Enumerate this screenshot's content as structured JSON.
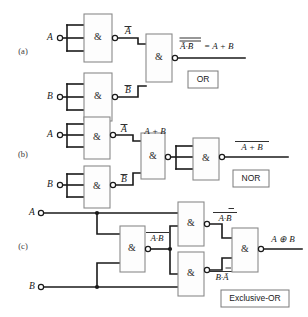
{
  "figure": {
    "gate_symbol": "&",
    "panels": [
      {
        "id": "(a)",
        "function_label": "OR",
        "inputs": [
          "A",
          "B"
        ],
        "intermediate_labels": [
          "Ā",
          "B̄"
        ],
        "output_expression_left": "Ā·B̄",
        "output_expression_right": "= A + B",
        "gate_count": 3
      },
      {
        "id": "(b)",
        "function_label": "NOR",
        "inputs": [
          "A",
          "B"
        ],
        "intermediate_labels": [
          "Ā",
          "B̄"
        ],
        "mid_expression": "A + B",
        "output_expression": "A + B",
        "gate_count": 4
      },
      {
        "id": "(c)",
        "function_label": "Exclusive-OR",
        "inputs": [
          "A",
          "B"
        ],
        "mid_expression": "A·B",
        "upper_expression": "A·B̄",
        "lower_expression": "B·Ā",
        "output_expression": "A ⊕ B",
        "gate_count": 4
      }
    ],
    "colors": {
      "wire": "#1a1a1a",
      "gate_stroke": "#8a8a8a",
      "gate_fill": "#fdfdfd",
      "background": "#ffffff"
    }
  }
}
